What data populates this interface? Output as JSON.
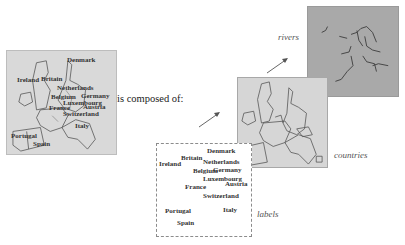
{
  "composite_map": {
    "labels": [
      "Denmark",
      "Ireland",
      "Britain",
      "Netherlands",
      "Belgium",
      "Germany",
      "Luxembourg",
      "France",
      "Austria",
      "Switzerland",
      "Italy",
      "Portugal",
      "Spain"
    ]
  },
  "connector_text": "is composed of:",
  "layers": {
    "labels": {
      "caption": "labels",
      "items": [
        "Denmark",
        "Britain",
        "Ireland",
        "Netherlands",
        "Belgium",
        "Germany",
        "Luxembourg",
        "France",
        "Austria",
        "Switzerland",
        "Portugal",
        "Italy",
        "Spain"
      ]
    },
    "countries": {
      "caption": "countries"
    },
    "rivers": {
      "caption": "rivers"
    }
  },
  "colors": {
    "composite_bg": "#d9d9d9",
    "countries_bg": "#d6d6d6",
    "rivers_bg": "#a9a9a9",
    "border_line": "#555555"
  }
}
